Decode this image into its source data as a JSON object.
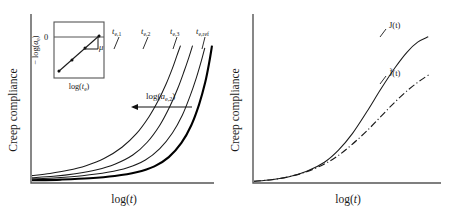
{
  "figure": {
    "background": "#ffffff",
    "ink": "#1a1a1a",
    "axis_color": "#555555"
  },
  "panels": [
    {
      "id": "left",
      "name": "aging-time-shift-panel",
      "ylabel": "Creep compliance",
      "xlabel": "log(t)",
      "curve_labels": [
        {
          "base": "t",
          "sub": "e,1",
          "x": 118,
          "y": 33
        },
        {
          "base": "t",
          "sub": "e,2",
          "x": 147,
          "y": 33
        },
        {
          "base": "t",
          "sub": "e,3",
          "x": 176,
          "y": 33
        },
        {
          "base": "t",
          "sub": "e,ref",
          "x": 202,
          "y": 33
        }
      ],
      "annotation": {
        "text_base": "log(a",
        "text_sub": "e,2",
        "text_end": ")",
        "x": 150,
        "y": 92
      },
      "inset": {
        "ylabel_pre": "− log(a",
        "ylabel_sub": "e",
        "ylabel_post": ")",
        "xlabel_pre": "log(t",
        "xlabel_sub": "e",
        "xlabel_post": ")",
        "zero_tick": "0",
        "slope_symbol": "μ"
      }
    },
    {
      "id": "right",
      "name": "effective-time-compliance-panel",
      "ylabel": "Creep compliance",
      "xlabel": "log(t)",
      "curve_labels": [
        {
          "text": "J(t)",
          "style": "solid",
          "x": 392,
          "y": 28
        },
        {
          "text": "J̃(t)",
          "style": "dash-dot",
          "x": 392,
          "y": 76
        }
      ]
    }
  ],
  "chart_data": {
    "type": "line",
    "title": "",
    "panels": [
      {
        "name": "Creep compliance vs log(t) for increasing aging time",
        "xlabel": "log(t)",
        "ylabel": "Creep compliance",
        "axis_ticks": false,
        "grid": false,
        "description": "Four upward-curving creep compliance curves shifted to longer times with increasing aging time; the reference curve is drawn thicker.",
        "series": [
          {
            "name": "t_e,1",
            "linewidth": "thin",
            "style": "solid",
            "points": [
              [
                0.0,
                0.045
              ],
              [
                0.1,
                0.06
              ],
              [
                0.2,
                0.082
              ],
              [
                0.3,
                0.115
              ],
              [
                0.4,
                0.165
              ],
              [
                0.5,
                0.245
              ],
              [
                0.58,
                0.34
              ],
              [
                0.65,
                0.46
              ],
              [
                0.7,
                0.57
              ],
              [
                0.745,
                0.69
              ],
              [
                0.78,
                0.8
              ],
              [
                0.805,
                0.89
              ],
              [
                0.825,
                0.96
              ]
            ]
          },
          {
            "name": "t_e,2",
            "linewidth": "thin",
            "style": "solid",
            "points": [
              [
                0.0,
                0.03
              ],
              [
                0.12,
                0.04
              ],
              [
                0.24,
                0.058
              ],
              [
                0.36,
                0.086
              ],
              [
                0.46,
                0.125
              ],
              [
                0.56,
                0.19
              ],
              [
                0.64,
                0.28
              ],
              [
                0.71,
                0.4
              ],
              [
                0.765,
                0.53
              ],
              [
                0.81,
                0.66
              ],
              [
                0.845,
                0.78
              ],
              [
                0.872,
                0.88
              ],
              [
                0.892,
                0.96
              ]
            ]
          },
          {
            "name": "t_e,3",
            "linewidth": "thin",
            "style": "solid",
            "points": [
              [
                0.0,
                0.022
              ],
              [
                0.14,
                0.03
              ],
              [
                0.28,
                0.044
              ],
              [
                0.42,
                0.068
              ],
              [
                0.53,
                0.1
              ],
              [
                0.63,
                0.155
              ],
              [
                0.71,
                0.235
              ],
              [
                0.78,
                0.345
              ],
              [
                0.835,
                0.47
              ],
              [
                0.878,
                0.605
              ],
              [
                0.912,
                0.73
              ],
              [
                0.94,
                0.85
              ],
              [
                0.96,
                0.945
              ]
            ]
          },
          {
            "name": "t_e,ref",
            "linewidth": "thick",
            "style": "solid",
            "points": [
              [
                0.0,
                0.012
              ],
              [
                0.16,
                0.017
              ],
              [
                0.32,
                0.026
              ],
              [
                0.46,
                0.042
              ],
              [
                0.58,
                0.068
              ],
              [
                0.68,
                0.11
              ],
              [
                0.76,
                0.175
              ],
              [
                0.83,
                0.275
              ],
              [
                0.885,
                0.4
              ],
              [
                0.928,
                0.545
              ],
              [
                0.962,
                0.7
              ],
              [
                0.985,
                0.845
              ],
              [
                1.0,
                0.96
              ]
            ]
          }
        ],
        "annotations": [
          {
            "text": "log(a_e,2)",
            "type": "horizontal-arrow",
            "direction": "left",
            "from_x": 0.88,
            "to_x": 0.47,
            "y": 0.62
          }
        ],
        "inset": {
          "name": "aging-shift-factor-inset",
          "type": "scatter-line",
          "xlabel": "log(t_e)",
          "ylabel": "− log(a_e)",
          "y_tick_labels": [
            "0"
          ],
          "slope_annotation": "μ",
          "points": [
            [
              0.08,
              0.12
            ],
            [
              0.38,
              0.42
            ],
            [
              0.62,
              0.64
            ],
            [
              0.93,
              0.9
            ]
          ],
          "line": [
            [
              0.04,
              0.08
            ],
            [
              0.95,
              0.92
            ]
          ]
        }
      },
      {
        "name": "Creep compliance: real time J(t) vs effective time J-tilde(t)",
        "xlabel": "log(t)",
        "ylabel": "Creep compliance",
        "axis_ticks": false,
        "grid": false,
        "description": "Two sigmoidal creep compliance curves coinciding at short times then diverging; the solid J(t) rises higher than the dash-dotted J-tilde(t).",
        "series": [
          {
            "name": "J(t)",
            "style": "solid",
            "points": [
              [
                0.0,
                0.005
              ],
              [
                0.1,
                0.015
              ],
              [
                0.2,
                0.035
              ],
              [
                0.3,
                0.07
              ],
              [
                0.4,
                0.13
              ],
              [
                0.48,
                0.21
              ],
              [
                0.56,
                0.32
              ],
              [
                0.64,
                0.46
              ],
              [
                0.72,
                0.61
              ],
              [
                0.8,
                0.75
              ],
              [
                0.87,
                0.855
              ],
              [
                0.93,
                0.92
              ],
              [
                0.99,
                0.955
              ]
            ]
          },
          {
            "name": "J̃(t)",
            "style": "dash-dot",
            "points": [
              [
                0.0,
                0.005
              ],
              [
                0.1,
                0.015
              ],
              [
                0.2,
                0.035
              ],
              [
                0.3,
                0.068
              ],
              [
                0.4,
                0.118
              ],
              [
                0.48,
                0.175
              ],
              [
                0.56,
                0.25
              ],
              [
                0.64,
                0.335
              ],
              [
                0.72,
                0.43
              ],
              [
                0.8,
                0.525
              ],
              [
                0.88,
                0.61
              ],
              [
                0.95,
                0.672
              ],
              [
                1.0,
                0.71
              ]
            ]
          }
        ]
      }
    ]
  }
}
